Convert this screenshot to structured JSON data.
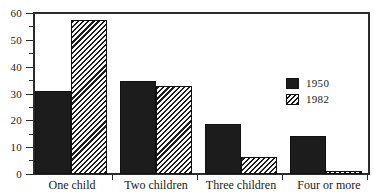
{
  "chart_data": {
    "type": "bar",
    "title": "",
    "subtitle": "",
    "xlabel": "",
    "ylabel": "",
    "categories": [
      "One child",
      "Two children",
      "Three children",
      "Four or more"
    ],
    "series": [
      {
        "name": "1950",
        "values": [
          31.0,
          34.7,
          18.6,
          14.0
        ],
        "style": "solid",
        "color": "#1c1c1c"
      },
      {
        "name": "1982",
        "values": [
          57.5,
          32.7,
          6.4,
          1.0
        ],
        "style": "diagonal-hatch",
        "color": "#1c1c1c"
      }
    ],
    "ylim": [
      0,
      60
    ],
    "ytick_labels": [
      "0",
      "10",
      "20",
      "30",
      "40",
      "50",
      "60"
    ],
    "ytick_values": [
      0,
      10,
      20,
      30,
      40,
      50,
      60
    ],
    "yminor_values": [
      5,
      15,
      25,
      35,
      45,
      55
    ],
    "grid": false,
    "legend_position": "upper-right",
    "legend_entries": [
      "1950",
      "1982"
    ]
  },
  "axes": {
    "y": {
      "ticks": [
        {
          "label": "60",
          "value": 60
        },
        {
          "label": "50",
          "value": 50
        },
        {
          "label": "40",
          "value": 40
        },
        {
          "label": "30",
          "value": 30
        },
        {
          "label": "20",
          "value": 20
        },
        {
          "label": "10",
          "value": 10
        },
        {
          "label": "0",
          "value": 0
        }
      ]
    },
    "x": {
      "ticks": [
        {
          "label": "One child"
        },
        {
          "label": "Two children"
        },
        {
          "label": "Three children"
        },
        {
          "label": "Four or more"
        }
      ]
    }
  },
  "legend": {
    "items": [
      {
        "label": "1950",
        "style": "solid"
      },
      {
        "label": "1982",
        "style": "hatch"
      }
    ]
  }
}
